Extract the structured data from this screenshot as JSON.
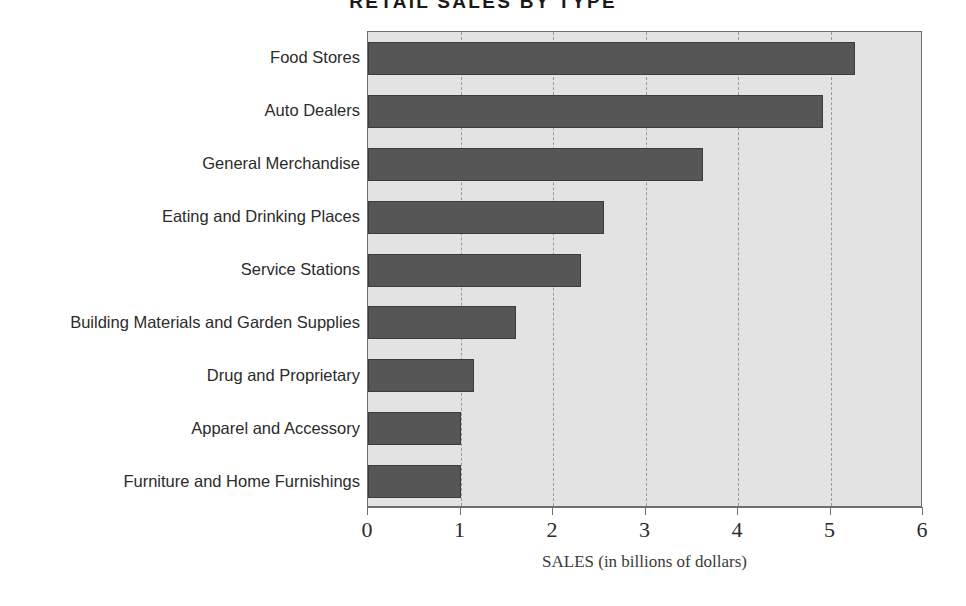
{
  "chart_data": {
    "type": "bar",
    "orientation": "horizontal",
    "title": "RETAIL SALES BY TYPE",
    "xlabel": "SALES (in billions of dollars)",
    "ylabel": "",
    "xlim": [
      0,
      6
    ],
    "xticks": [
      0,
      1,
      2,
      3,
      4,
      5,
      6
    ],
    "xtick_labels": [
      "0",
      "1",
      "2",
      "3",
      "4",
      "5",
      "6"
    ],
    "grid": true,
    "grid_axis": "x",
    "grid_style": "dashed",
    "legend": false,
    "categories": [
      "Food Stores",
      "Auto Dealers",
      "General Merchandise",
      "Eating and Drinking Places",
      "Service Stations",
      "Building Materials and Garden Supplies",
      "Drug and Proprietary",
      "Apparel and Accessory",
      "Furniture and Home Furnishings"
    ],
    "values": [
      5.27,
      4.92,
      3.62,
      2.55,
      2.3,
      1.6,
      1.15,
      1.0,
      1.0
    ],
    "units": "billions of dollars",
    "bar_color": "#565656",
    "bar_edge_color": "#3c3c3c",
    "plot_background": "#e3e3e3",
    "axis_color": "#6f6f6f",
    "gridline_color": "#9a9a9a",
    "figure_background": "#ffffff"
  }
}
